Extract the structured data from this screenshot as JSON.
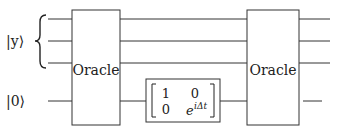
{
  "diagram": {
    "type": "quantum-circuit",
    "inputs": {
      "register_label": "|y⟩",
      "ancilla_label": "|0⟩"
    },
    "gates": [
      {
        "id": "oracle-1",
        "label": "Oracle"
      },
      {
        "id": "phase-gate",
        "matrix": [
          [
            "1",
            "0"
          ],
          [
            "0",
            "e"
          ]
        ],
        "exponent": "iΔt"
      },
      {
        "id": "oracle-2",
        "label": "Oracle"
      }
    ]
  }
}
